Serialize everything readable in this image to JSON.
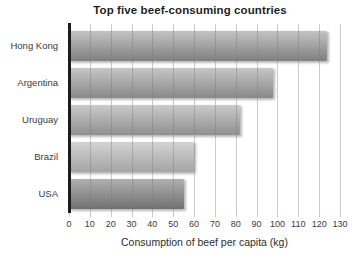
{
  "chart_data": {
    "type": "bar",
    "orientation": "horizontal",
    "title": "Top five beef-consuming countries",
    "categories": [
      "Hong Kong",
      "Argentina",
      "Uruguay",
      "Brazil",
      "USA"
    ],
    "values": [
      124,
      98,
      82,
      60,
      55
    ],
    "xlabel": "Consumption of beef per capita (kg)",
    "ylabel": "",
    "xlim": [
      0,
      130
    ],
    "xticks": [
      0,
      10,
      20,
      30,
      40,
      50,
      60,
      70,
      80,
      90,
      100,
      110,
      120,
      130
    ],
    "grid": true,
    "legend_position": "none",
    "colors": {
      "background": "#ffffff",
      "gridline": "#cccccc",
      "axis_line": "#1c1c1c",
      "text": "#3b3b3b",
      "bar_gradients": [
        {
          "top": "#c3c3c3",
          "bottom": "#7f7f7f"
        },
        {
          "top": "#c6c6c6",
          "bottom": "#898989"
        },
        {
          "top": "#cacaca",
          "bottom": "#909090"
        },
        {
          "top": "#d3d3d3",
          "bottom": "#a5a5a5"
        },
        {
          "top": "#b0b0b0",
          "bottom": "#707070"
        }
      ]
    }
  }
}
